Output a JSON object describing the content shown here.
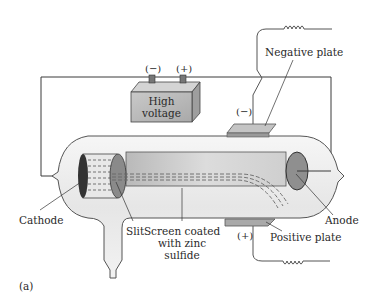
{
  "figure_label": "(a)",
  "battery": {
    "label_line1": "High",
    "label_line2": "voltage",
    "terminal_negative": "(−)",
    "terminal_positive": "(+)"
  },
  "plates": {
    "negative": {
      "label": "Negative plate",
      "sign": "(−)"
    },
    "positive": {
      "label": "Positive plate",
      "sign": "(+)"
    }
  },
  "labels": {
    "cathode": "Cathode",
    "anode": "Anode",
    "slit": "Slit",
    "screen_line1": "Screen coated",
    "screen_line2": "with zinc",
    "screen_line3": "sulfide"
  },
  "colors": {
    "wire": "#3a3a3a",
    "glass": "#ececec",
    "battery": "#bdbdbd",
    "plate": "#a9a9a9",
    "screen": "#d9d9d9",
    "anode": "#8f8f8f"
  }
}
